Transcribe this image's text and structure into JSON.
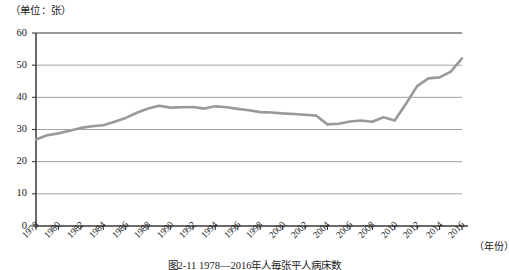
{
  "unit_label": "（单位：张）",
  "caption": "图2-11  1978—2016年人毎张平人病床数",
  "axis": {
    "x_axis_name": "（年份）",
    "y_ticks": [
      "60",
      "50",
      "40",
      "30",
      "20",
      "10",
      "0"
    ],
    "x_ticks": [
      "1978",
      "1980",
      "1982",
      "1984",
      "1986",
      "1988",
      "1990",
      "1992",
      "1994",
      "1996",
      "1998",
      "2000",
      "2002",
      "2004",
      "2006",
      "2008",
      "2010",
      "2012",
      "2014",
      "2016"
    ]
  },
  "colors": {
    "line": "#999999",
    "grid": "#7a7a7a",
    "frame": "#3a3a3a",
    "text": "#1c1c1c"
  },
  "chart_data": {
    "type": "line",
    "title": "",
    "subtitle": "",
    "xlabel": "（年份）",
    "ylabel": "（单位：张）",
    "xlim": [
      1978,
      2016
    ],
    "ylim": [
      0,
      60
    ],
    "grid": true,
    "legend": null,
    "series": [
      {
        "name": "每万人平均病床数",
        "color": "#999999",
        "x": [
          1978,
          1979,
          1980,
          1981,
          1982,
          1983,
          1984,
          1985,
          1986,
          1987,
          1988,
          1989,
          1990,
          1991,
          1992,
          1993,
          1994,
          1995,
          1996,
          1997,
          1998,
          1999,
          2000,
          2001,
          2002,
          2003,
          2004,
          2005,
          2006,
          2007,
          2008,
          2009,
          2010,
          2011,
          2012,
          2013,
          2014,
          2015,
          2016
        ],
        "values": [
          26.9,
          28.2,
          28.8,
          29.6,
          30.5,
          31.0,
          31.3,
          32.4,
          33.6,
          35.2,
          36.5,
          37.4,
          36.8,
          36.9,
          37.0,
          36.5,
          37.2,
          36.9,
          36.4,
          36.0,
          35.4,
          35.3,
          35.0,
          34.8,
          34.6,
          34.3,
          31.6,
          31.8,
          32.5,
          32.8,
          32.4,
          33.8,
          32.8,
          38.0,
          43.5,
          45.9,
          46.2,
          48.0,
          52.1
        ]
      }
    ]
  }
}
